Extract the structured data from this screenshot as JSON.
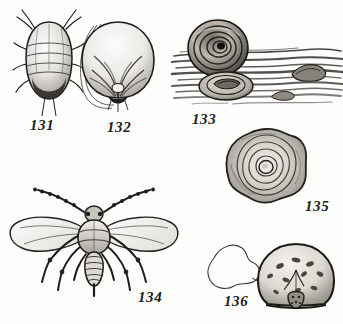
{
  "plate": {
    "title": "Scale insect life stages plate",
    "background_color": "#fdfdfc",
    "ink_color": "#1b1b1b",
    "figures": [
      {
        "number": "131",
        "caption": "131",
        "subject": "larva-dorsal-view",
        "description": "Oval segmented larva, dorsal view, with antennae, legs and dark posterior tip",
        "caption_x": 30,
        "caption_y": 118,
        "caption_size": 15
      },
      {
        "number": "132",
        "caption": "132",
        "subject": "female-scale-underside",
        "description": "Rounded adult female with radiating creases and trailing waxy filaments",
        "caption_x": 107,
        "caption_y": 120,
        "caption_size": 15
      },
      {
        "number": "133",
        "caption": "133",
        "subject": "scales-on-bark",
        "description": "Two concentric scales resting on a streaked strip of bark",
        "caption_x": 192,
        "caption_y": 112,
        "caption_size": 15
      },
      {
        "number": "134",
        "caption": "134",
        "subject": "winged-adult-male",
        "description": "Winged adult male with two large wings, beaded antennae, six legs and long caudal style",
        "caption_x": 138,
        "caption_y": 290,
        "caption_size": 15
      },
      {
        "number": "135",
        "caption": "135",
        "subject": "mature-scale-enlarged",
        "description": "Enlarged mature scale with wavy rim, concentric growth rings and central nipple",
        "caption_x": 305,
        "caption_y": 199,
        "caption_size": 15
      },
      {
        "number": "136",
        "caption": "136",
        "subject": "scale-with-outline",
        "description": "Dome shaped speckled scale with Y ridge, small bud beneath, and an irregular outline shape at left",
        "caption_x": 224,
        "caption_y": 294,
        "caption_size": 15
      }
    ]
  }
}
